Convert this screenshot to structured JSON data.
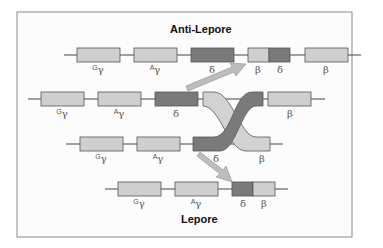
{
  "diagram": {
    "title_top": "Anti-Lepore",
    "title_bottom": "Lepore",
    "colors": {
      "light_gene": "#cfcfcf",
      "dark_gene": "#7a7a7a",
      "outline": "#555555",
      "line": "#444444",
      "arrow": "#b8b8b8",
      "frame": "#888888"
    },
    "rows": [
      {
        "name": "anti-lepore-chromosome",
        "genes": [
          {
            "id": "G-gamma",
            "sup": "G",
            "sym": "γ",
            "shade": "light"
          },
          {
            "id": "A-gamma",
            "sup": "A",
            "sym": "γ",
            "shade": "light"
          },
          {
            "id": "delta",
            "sup": "",
            "sym": "δ",
            "shade": "dark"
          },
          {
            "id": "beta-delta-hybrid-beta",
            "sup": "",
            "sym": "β",
            "shade": "light"
          },
          {
            "id": "beta-delta-hybrid-delta",
            "sup": "",
            "sym": "δ",
            "shade": "dark"
          },
          {
            "id": "beta",
            "sup": "",
            "sym": "β",
            "shade": "light"
          }
        ]
      },
      {
        "name": "upper-parental-chromosome",
        "genes": [
          {
            "id": "G-gamma",
            "sup": "G",
            "sym": "γ",
            "shade": "light"
          },
          {
            "id": "A-gamma",
            "sup": "A",
            "sym": "γ",
            "shade": "light"
          },
          {
            "id": "delta",
            "sup": "",
            "sym": "δ",
            "shade": "dark"
          },
          {
            "id": "beta",
            "sup": "",
            "sym": "β",
            "shade": "light"
          }
        ]
      },
      {
        "name": "lower-parental-chromosome",
        "genes": [
          {
            "id": "G-gamma",
            "sup": "G",
            "sym": "γ",
            "shade": "light"
          },
          {
            "id": "A-gamma",
            "sup": "A",
            "sym": "γ",
            "shade": "light"
          },
          {
            "id": "delta",
            "sup": "",
            "sym": "δ",
            "shade": "dark"
          },
          {
            "id": "beta",
            "sup": "",
            "sym": "β",
            "shade": "light"
          }
        ]
      },
      {
        "name": "lepore-chromosome",
        "genes": [
          {
            "id": "G-gamma",
            "sup": "G",
            "sym": "γ",
            "shade": "light"
          },
          {
            "id": "A-gamma",
            "sup": "A",
            "sym": "γ",
            "shade": "light"
          },
          {
            "id": "delta-beta-hybrid-delta",
            "sup": "",
            "sym": "δ",
            "shade": "dark"
          },
          {
            "id": "delta-beta-hybrid-beta",
            "sup": "",
            "sym": "β",
            "shade": "light"
          }
        ]
      }
    ]
  }
}
